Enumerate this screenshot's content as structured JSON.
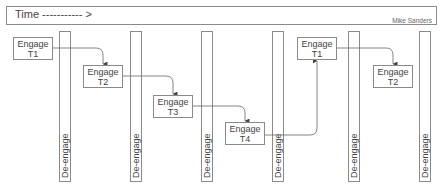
{
  "header": {
    "time_label": "Time ----------- >",
    "author": "Mike Sanders"
  },
  "bars": [
    {
      "label": "De-engage",
      "x": 59
    },
    {
      "label": "De-engage",
      "x": 130
    },
    {
      "label": "De-engage",
      "x": 201
    },
    {
      "label": "De-engage",
      "x": 272
    },
    {
      "label": "De-engage",
      "x": 348
    },
    {
      "label": "De-engage",
      "x": 419
    }
  ],
  "boxes": [
    {
      "line1": "Engage",
      "line2": "T1",
      "x": 13,
      "y": 37
    },
    {
      "line1": "Engage",
      "line2": "T2",
      "x": 83,
      "y": 65
    },
    {
      "line1": "Engage",
      "line2": "T3",
      "x": 153,
      "y": 95
    },
    {
      "line1": "Engage",
      "line2": "T4",
      "x": 225,
      "y": 122
    },
    {
      "line1": "Engage",
      "line2": "T1",
      "x": 297,
      "y": 37
    },
    {
      "line1": "Engage",
      "line2": "T2",
      "x": 373,
      "y": 65
    }
  ],
  "colors": {
    "stroke": "#8a8a8a",
    "arrow": "#555555",
    "text": "#444444"
  }
}
